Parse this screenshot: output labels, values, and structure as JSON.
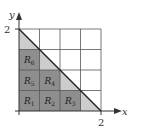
{
  "diagram": {
    "axes": {
      "x_label": "x",
      "y_label": "y",
      "x_tick": "2",
      "y_tick": "2"
    },
    "grid": {
      "cols": 4,
      "rows": 4,
      "xmax": 2,
      "ymax": 2
    },
    "regions": [
      {
        "name": "R",
        "sub": "1",
        "col": 0,
        "row": 0
      },
      {
        "name": "R",
        "sub": "2",
        "col": 1,
        "row": 0
      },
      {
        "name": "R",
        "sub": "3",
        "col": 2,
        "row": 0
      },
      {
        "name": "R",
        "sub": "4",
        "col": 1,
        "row": 1
      },
      {
        "name": "R",
        "sub": "5",
        "col": 0,
        "row": 1
      },
      {
        "name": "R",
        "sub": "6",
        "col": 0,
        "row": 2
      }
    ],
    "line": "x + y = 2",
    "colors": {
      "inner_cells": "#8e8e8e",
      "triangle_fill": "#cdcdcd",
      "grid_line": "#555555",
      "axis": "#333333"
    }
  }
}
